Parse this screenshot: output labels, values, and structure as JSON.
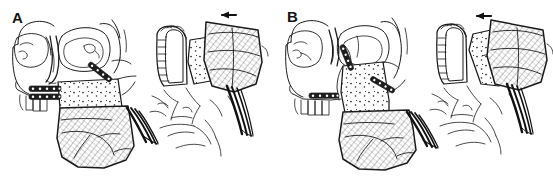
{
  "figure": {
    "background_color": "#ffffff",
    "ink_color": "#1a1a1a",
    "width": 553,
    "height": 179,
    "style": "black and white pen-and-ink medical line drawing",
    "panel_count": 2
  },
  "panels": [
    {
      "id": "A",
      "label": "A",
      "views": [
        {
          "name": "lateral-skull-view",
          "description": "Lateral view of skull showing maxilla downfractured and fixed with two horizontal ladder miniplates and one oblique miniplate; vascularized muscle flap with pedicle below",
          "features": [
            "orbit-outline",
            "zygomatic-arch",
            "nasal-bone",
            "maxillary-segment-stippled",
            "maxillary-teeth",
            "horizontal-plate-upper",
            "horizontal-plate-lower",
            "oblique-plate",
            "muscle-flap-hatched",
            "vascular-pedicle"
          ],
          "plates": [
            {
              "name": "horizontal-plate-upper",
              "orientation": "horizontal",
              "screw_count": 5
            },
            {
              "name": "horizontal-plate-lower",
              "orientation": "horizontal",
              "screw_count": 5
            },
            {
              "name": "oblique-plate",
              "orientation": "oblique",
              "screw_count": 4
            }
          ]
        },
        {
          "name": "occlusal-inferior-view",
          "description": "Inferior occlusal view of palate with tooth-bearing arch on left and stippled bone graft segment on right, muscle flap hatched and reflected posteriorly, arrow indicating direction of flap rotation",
          "features": [
            "palatal-arch",
            "teeth-row",
            "bone-graft-stippled",
            "muscle-flap-hatched",
            "vascular-pedicle",
            "direction-arrow"
          ],
          "arrow": {
            "name": "flap-direction-arrow",
            "direction": "left"
          }
        }
      ]
    },
    {
      "id": "B",
      "label": "B",
      "views": [
        {
          "name": "lateral-skull-view",
          "description": "Lateral view of skull with maxillary segment advanced and rotated, fixed with a superior oblique plate at the infraorbital rim, a lateral oblique plate and a horizontal plate at the alveolus; vascularized muscle flap with pedicle below",
          "features": [
            "orbit-outline",
            "zygomatic-arch",
            "nasal-bone",
            "maxillary-segment-stippled",
            "maxillary-teeth",
            "superior-oblique-plate",
            "lateral-oblique-plate",
            "horizontal-plate-alveolar",
            "muscle-flap-hatched",
            "vascular-pedicle"
          ],
          "plates": [
            {
              "name": "superior-oblique-plate",
              "orientation": "oblique",
              "screw_count": 4
            },
            {
              "name": "lateral-oblique-plate",
              "orientation": "oblique",
              "screw_count": 4
            },
            {
              "name": "horizontal-plate-alveolar",
              "orientation": "horizontal",
              "screw_count": 5
            }
          ]
        },
        {
          "name": "occlusal-inferior-view",
          "description": "Inferior occlusal view of palate with tooth-bearing arch on left and angulated stippled bone graft segment on right secured by a plate along its edge, muscle flap hatched and reflected posteriorly, arrow indicating direction of flap rotation",
          "features": [
            "palatal-arch",
            "teeth-row",
            "bone-graft-stippled-rotated",
            "edge-plate",
            "muscle-flap-hatched",
            "vascular-pedicle",
            "direction-arrow"
          ],
          "arrow": {
            "name": "flap-direction-arrow",
            "direction": "left"
          }
        }
      ]
    }
  ]
}
